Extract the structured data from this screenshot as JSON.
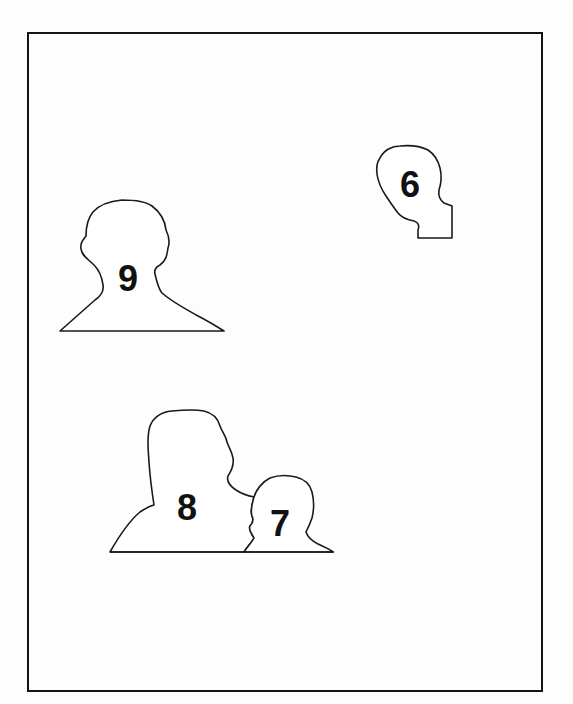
{
  "figure": {
    "stroke_color": "#1a1a1a",
    "fill_color": "#ffffff",
    "background_color": "#fdfdfd",
    "silhouettes": [
      {
        "id": "6",
        "label": "6",
        "kind": "head-profile",
        "label_pos": {
          "x": 410,
          "y": 185
        }
      },
      {
        "id": "9",
        "label": "9",
        "kind": "head-and-shoulders",
        "label_pos": {
          "x": 128,
          "y": 279
        }
      },
      {
        "id": "8",
        "label": "8",
        "kind": "adult-head-and-shoulders",
        "label_pos": {
          "x": 187,
          "y": 508
        }
      },
      {
        "id": "7",
        "label": "7",
        "kind": "child-head-and-shoulders",
        "label_pos": {
          "x": 280,
          "y": 524
        }
      }
    ]
  }
}
